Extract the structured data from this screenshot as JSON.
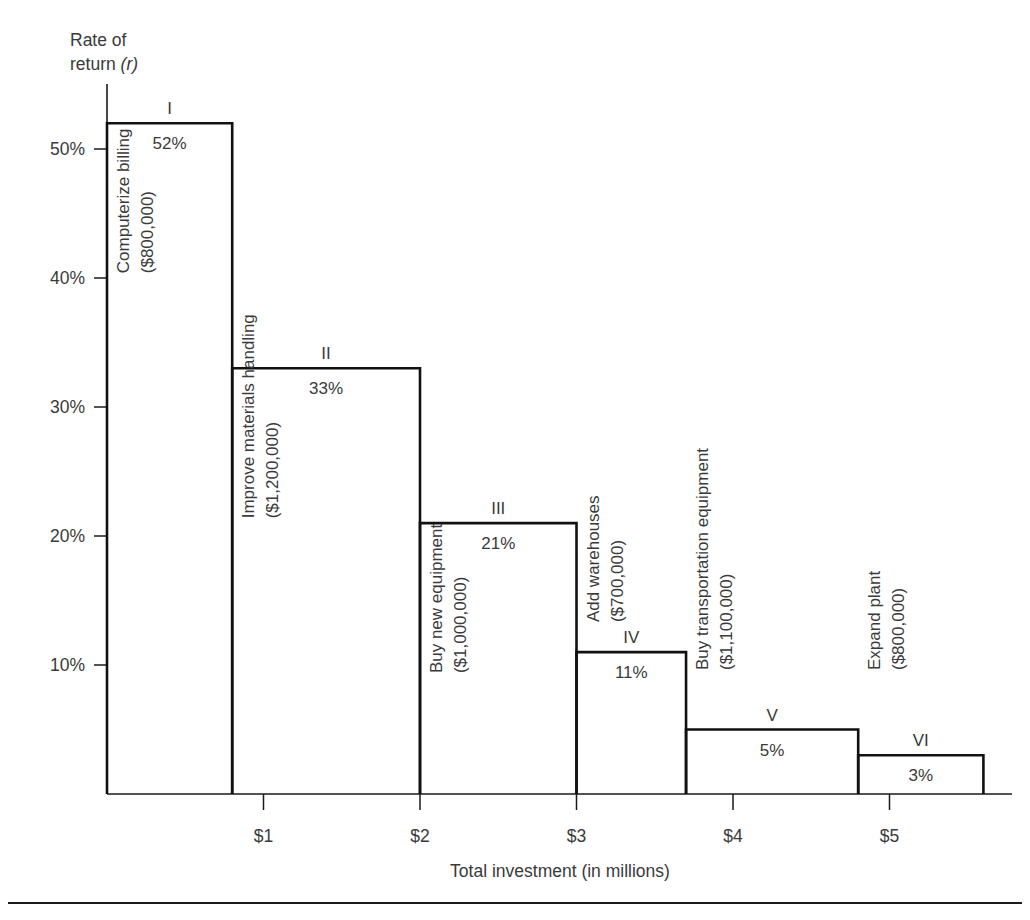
{
  "figure": {
    "axis_label_y_line1": "Rate of",
    "axis_label_y_line2_prefix": "return ",
    "axis_label_y_line2_italic": "(r)",
    "axis_title_x": "Total investment (in millions)"
  },
  "chart_data": {
    "type": "bar",
    "title": "",
    "subtitle": "",
    "xlabel": "Total investment (in millions)",
    "ylabel": "Rate of return (r)",
    "orientation": "vertical",
    "grid": false,
    "legend": "none",
    "note": "Investment opportunity schedule: bar widths equal project cost in millions, bar heights equal rate of return.",
    "xlim": [
      0,
      5.55
    ],
    "ylim": [
      0,
      56
    ],
    "x_unit": "millions of dollars",
    "y_unit": "percent",
    "xticks": [
      1,
      2,
      3,
      4,
      5
    ],
    "xtick_labels": [
      "$1",
      "$2",
      "$3",
      "$4",
      "$5"
    ],
    "yticks": [
      10,
      20,
      30,
      40,
      50
    ],
    "ytick_labels": [
      "10%",
      "20%",
      "30%",
      "40%",
      "50%"
    ],
    "categories": [
      "I",
      "II",
      "III",
      "IV",
      "V",
      "VI"
    ],
    "values": [
      52,
      33,
      21,
      11,
      5,
      3
    ],
    "value_labels": [
      "52%",
      "33%",
      "21%",
      "11%",
      "5%",
      "3%"
    ],
    "widths_millions": [
      0.8,
      1.2,
      1.0,
      0.7,
      1.1,
      0.8
    ],
    "x_starts_millions": [
      0,
      0.8,
      2.0,
      3.0,
      3.7,
      4.8
    ],
    "x_ends_millions": [
      0.8,
      2.0,
      3.0,
      3.7,
      4.8,
      5.6
    ],
    "bars": [
      {
        "roman": "I",
        "value": 52,
        "value_label": "52%",
        "project": "Computerize billing",
        "cost_label": "($800,000)",
        "cost": 800000,
        "x_start": 0,
        "x_end": 0.8
      },
      {
        "roman": "II",
        "value": 33,
        "value_label": "33%",
        "project": "Improve materials handling",
        "cost_label": "($1,200,000)",
        "cost": 1200000,
        "x_start": 0.8,
        "x_end": 2.0
      },
      {
        "roman": "III",
        "value": 21,
        "value_label": "21%",
        "project": "Buy new equipment",
        "cost_label": "($1,000,000)",
        "cost": 1000000,
        "x_start": 2.0,
        "x_end": 3.0
      },
      {
        "roman": "IV",
        "value": 11,
        "value_label": "11%",
        "project": "Add warehouses",
        "cost_label": "($700,000)",
        "cost": 700000,
        "x_start": 3.0,
        "x_end": 3.7
      },
      {
        "roman": "V",
        "value": 5,
        "value_label": "5%",
        "project": "Buy transportation equipment",
        "cost_label": "($1,100,000)",
        "cost": 1100000,
        "x_start": 3.7,
        "x_end": 4.8
      },
      {
        "roman": "VI",
        "value": 3,
        "value_label": "3%",
        "project": "Expand plant",
        "cost_label": "($800,000)",
        "cost": 800000,
        "x_start": 4.8,
        "x_end": 5.6
      }
    ],
    "colors": {
      "bar_stroke": "#111111",
      "bar_fill": "#ffffff",
      "axis": "#1a1a1a",
      "text": "#3a3a3a",
      "background": "#ffffff"
    }
  }
}
